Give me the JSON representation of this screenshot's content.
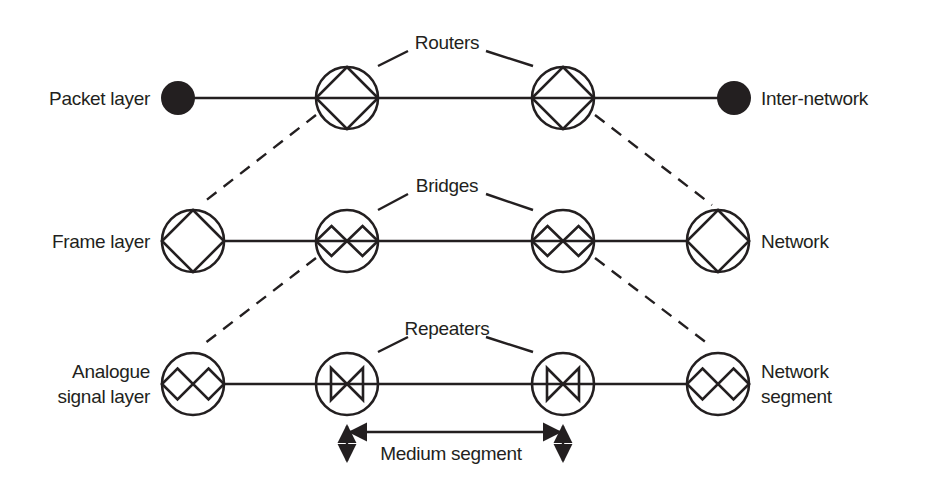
{
  "diagram": {
    "colors": {
      "ink": "#231f20",
      "background": "#ffffff"
    },
    "layers": [
      {
        "name": "Packet layer",
        "right_label": "Inter-network",
        "device_group": "Routers"
      },
      {
        "name": "Frame layer",
        "right_label": "Network",
        "device_group": "Bridges"
      },
      {
        "name": "Analogue signal layer",
        "name_lines": [
          "Analogue",
          "signal layer"
        ],
        "right_label": "Network segment",
        "right_label_lines": [
          "Network",
          "segment"
        ],
        "device_group": "Repeaters"
      }
    ],
    "labels": {
      "packet_layer": "Packet layer",
      "inter_network": "Inter-network",
      "routers": "Routers",
      "frame_layer": "Frame layer",
      "network": "Network",
      "bridges": "Bridges",
      "analogue_line1": "Analogue",
      "analogue_line2": "signal layer",
      "network_segment_line1": "Network",
      "network_segment_line2": "segment",
      "repeaters": "Repeaters",
      "medium_segment": "Medium segment"
    },
    "nodes": {
      "row1": [
        "endpoint-dot",
        "router",
        "router",
        "endpoint-dot"
      ],
      "row2": [
        "single-diamond",
        "bridge-double-diamond",
        "bridge-double-diamond",
        "single-diamond"
      ],
      "row3": [
        "double-diamond",
        "repeater-bowtie",
        "repeater-bowtie",
        "double-diamond"
      ]
    }
  }
}
